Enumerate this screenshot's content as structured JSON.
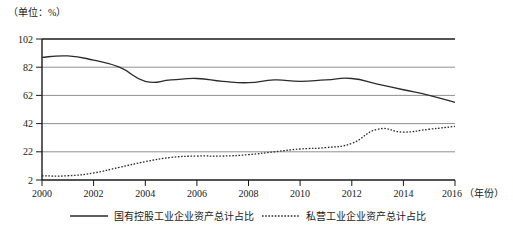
{
  "chart_data": {
    "type": "line",
    "title": "",
    "subtitle": "",
    "unit_label": "（单位：%）",
    "xlabel": "（年份）",
    "ylabel": "",
    "grid": true,
    "legend_position": "bottom",
    "xlim": [
      2000,
      2016
    ],
    "ylim": [
      2,
      102
    ],
    "yticks": [
      2,
      22,
      42,
      62,
      82,
      102
    ],
    "xticks": [
      2000,
      2002,
      2004,
      2006,
      2008,
      2010,
      2012,
      2014,
      2016
    ],
    "x": [
      2000,
      2001,
      2002,
      2003,
      2004,
      2005,
      2006,
      2007,
      2008,
      2009,
      2010,
      2011,
      2012,
      2013,
      2014,
      2015,
      2016
    ],
    "series": [
      {
        "name": "国有控股工业企业资产总计占比",
        "style": "solid",
        "color": "#2b2b2b",
        "values": [
          89,
          90,
          87,
          82,
          72,
          73,
          74,
          72,
          71,
          73,
          72,
          73,
          74,
          70,
          66,
          62,
          57
        ]
      },
      {
        "name": "私营工业企业资产总计占比",
        "style": "dotted",
        "color": "#2b2b2b",
        "values": [
          5,
          5,
          7,
          11,
          15,
          18,
          19,
          19,
          20,
          22,
          24,
          25,
          28,
          38,
          36,
          38,
          40
        ]
      }
    ]
  },
  "axis": {
    "ytick_labels": [
      "102",
      "82",
      "62",
      "42",
      "22",
      "2"
    ],
    "xtick_labels": [
      "2000",
      "2002",
      "2004",
      "2006",
      "2008",
      "2010",
      "2012",
      "2014",
      "2016"
    ],
    "x_axis_name": "（年份）",
    "unit_caption": "（单位：%）"
  },
  "legend": {
    "items": [
      {
        "label": "国有控股工业企业资产总计占比",
        "style": "solid"
      },
      {
        "label": "私营工业企业资产总计占比",
        "style": "dotted"
      }
    ]
  },
  "colors": {
    "line": "#2b2b2b",
    "grid": "#8c8c8c",
    "axis": "#1a1a1a",
    "background": "#ffffff"
  }
}
